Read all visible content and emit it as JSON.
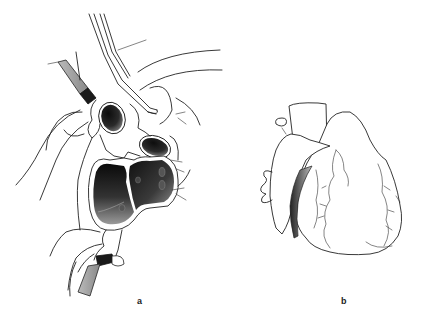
{
  "figure": {
    "panels": [
      {
        "id": "a",
        "label": "a",
        "description": "Surgical view of heart with opened chambers, clamped vessels and cannula"
      },
      {
        "id": "b",
        "label": "b",
        "description": "Explanted heart, external view"
      }
    ]
  },
  "colors": {
    "line": "#222222",
    "shade_dark": "#1a1a1a",
    "shade_mid": "#777777",
    "background": "#ffffff"
  }
}
